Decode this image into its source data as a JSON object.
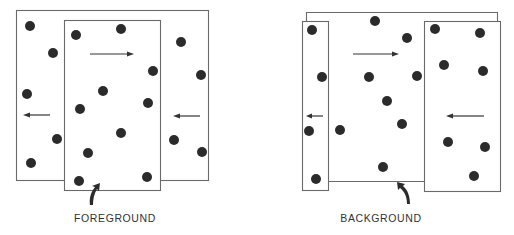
{
  "figure": {
    "panels": [
      {
        "id": "foreground",
        "label": "FOREGROUND",
        "description": "Front rectangle of dots moves right over a background rectangle of dots moving left",
        "front_motion": "right",
        "back_motion": "left"
      },
      {
        "id": "background",
        "label": "BACKGROUND",
        "description": "Middle region (background) moves right while flanking rectangles move left",
        "front_motion": "left",
        "back_motion": "right"
      }
    ],
    "colors": {
      "stroke": "#6a6a6a",
      "dot": "#2b2b2b",
      "background": "#ffffff"
    }
  }
}
